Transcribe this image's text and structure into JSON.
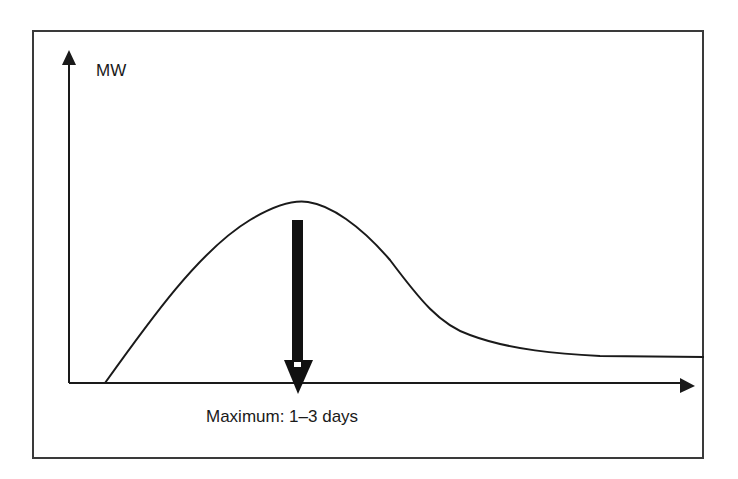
{
  "diagram": {
    "y_axis_label": "MW",
    "x_axis_label": "",
    "caption": "Maximum: 1–3 days",
    "colors": {
      "stroke": "#1a1a1a",
      "frame": "#3a3a3a",
      "background": "#ffffff"
    },
    "elements": {
      "y_axis": "vertical arrow pointing up",
      "x_axis": "horizontal arrow pointing right",
      "curve": "rises from baseline to a single peak, then decays to a low plateau",
      "marker": "thick downward arrow from peak to x-axis indicating time of maximum"
    }
  }
}
